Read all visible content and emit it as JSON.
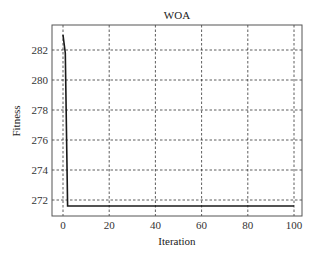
{
  "chart_data": {
    "type": "line",
    "title": "WOA",
    "xlabel": "Iteration",
    "ylabel": "Fitness",
    "xlim": [
      -2,
      103
    ],
    "ylim": [
      271,
      283.3
    ],
    "xticks": [
      0,
      20,
      40,
      60,
      80,
      100
    ],
    "yticks": [
      272,
      274,
      276,
      278,
      280,
      282
    ],
    "grid": true,
    "grid_style": "dashed",
    "legend": null,
    "series": [
      {
        "name": "WOA",
        "color": "#1a1a1a",
        "x": [
          0,
          1,
          2,
          3,
          10,
          20,
          30,
          40,
          50,
          60,
          70,
          80,
          90,
          100
        ],
        "y": [
          283.0,
          281.8,
          271.6,
          271.6,
          271.6,
          271.6,
          271.6,
          271.6,
          271.6,
          271.6,
          271.6,
          271.6,
          271.6,
          271.6
        ]
      }
    ]
  },
  "colors": {
    "line": "#1a1a1a",
    "grid": "#333333",
    "axis": "#555555",
    "background": "#ffffff"
  }
}
